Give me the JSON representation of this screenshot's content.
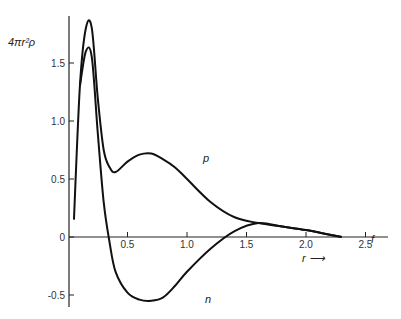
{
  "chart_data": {
    "type": "line",
    "title": "",
    "xlabel": "r",
    "ylabel": "4πr²ρ",
    "x_unit": "f",
    "xlim": [
      0,
      2.6
    ],
    "ylim": [
      -0.55,
      1.95
    ],
    "grid": false,
    "x_ticks": [
      "0.5",
      "1.0",
      "1.5",
      "2.0",
      "2.5"
    ],
    "y_ticks": [
      "-0.5",
      "0",
      "0.5",
      "1.0",
      "1.5"
    ],
    "series": [
      {
        "name": "p",
        "x": [
          0.05,
          0.1,
          0.15,
          0.2,
          0.25,
          0.3,
          0.35,
          0.4,
          0.5,
          0.6,
          0.7,
          0.8,
          0.9,
          1.0,
          1.2,
          1.4,
          1.6,
          1.8,
          2.0,
          2.2,
          2.3
        ],
        "y": [
          0.15,
          1.3,
          1.8,
          1.8,
          1.2,
          0.75,
          0.6,
          0.56,
          0.65,
          0.71,
          0.72,
          0.67,
          0.6,
          0.5,
          0.3,
          0.17,
          0.12,
          0.09,
          0.06,
          0.02,
          0.0
        ]
      },
      {
        "name": "n",
        "x": [
          0.1,
          0.15,
          0.2,
          0.25,
          0.3,
          0.35,
          0.4,
          0.5,
          0.6,
          0.7,
          0.8,
          0.9,
          1.0,
          1.2,
          1.4,
          1.6,
          1.8,
          2.0,
          2.2,
          2.3
        ],
        "y": [
          1.3,
          1.6,
          1.55,
          0.9,
          0.3,
          -0.05,
          -0.3,
          -0.48,
          -0.54,
          -0.55,
          -0.52,
          -0.42,
          -0.3,
          -0.1,
          0.05,
          0.12,
          0.09,
          0.06,
          0.02,
          0.0
        ]
      }
    ],
    "annotations": [
      "p",
      "n",
      "r →"
    ]
  }
}
